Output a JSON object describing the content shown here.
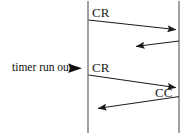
{
  "diagram": {
    "type": "sequence-timing-diagram",
    "title": "",
    "canvas": {
      "width": 194,
      "height": 140,
      "background": "#ffffff"
    },
    "stroke_color": "#1a1a1a",
    "lifelines": [
      {
        "name": "left-lifeline",
        "x": 88,
        "y_top": 1,
        "y_bottom": 133
      },
      {
        "name": "right-lifeline",
        "x": 179,
        "y_top": 1,
        "y_bottom": 133
      }
    ],
    "messages": [
      {
        "label": "CR",
        "direction": "left-to-right",
        "x1": 88,
        "y1": 20,
        "x2": 177,
        "y2": 30,
        "arrowhead": "end",
        "truncated": false
      },
      {
        "label": "",
        "direction": "right-to-left",
        "x1": 179,
        "y1": 41,
        "x2": 127,
        "y2": 47,
        "arrowhead": "end",
        "truncated": true
      },
      {
        "label": "CR",
        "direction": "left-to-right",
        "x1": 88,
        "y1": 75,
        "x2": 177,
        "y2": 88,
        "arrowhead": "end",
        "truncated": false
      },
      {
        "label": "CC",
        "direction": "right-to-left",
        "x1": 179,
        "y1": 97,
        "x2": 90,
        "y2": 109,
        "arrowhead": "end",
        "truncated": false
      }
    ],
    "annotations": [
      {
        "name": "timer-run-out",
        "text": "timer run out",
        "marker": "solid-right-triangle",
        "points_to_x": 88,
        "points_to_y": 68
      }
    ]
  },
  "labels": {
    "cr_first": "CR",
    "cr_second": "CR",
    "cc_first": "CC",
    "timer_run_out": "timer run out"
  }
}
